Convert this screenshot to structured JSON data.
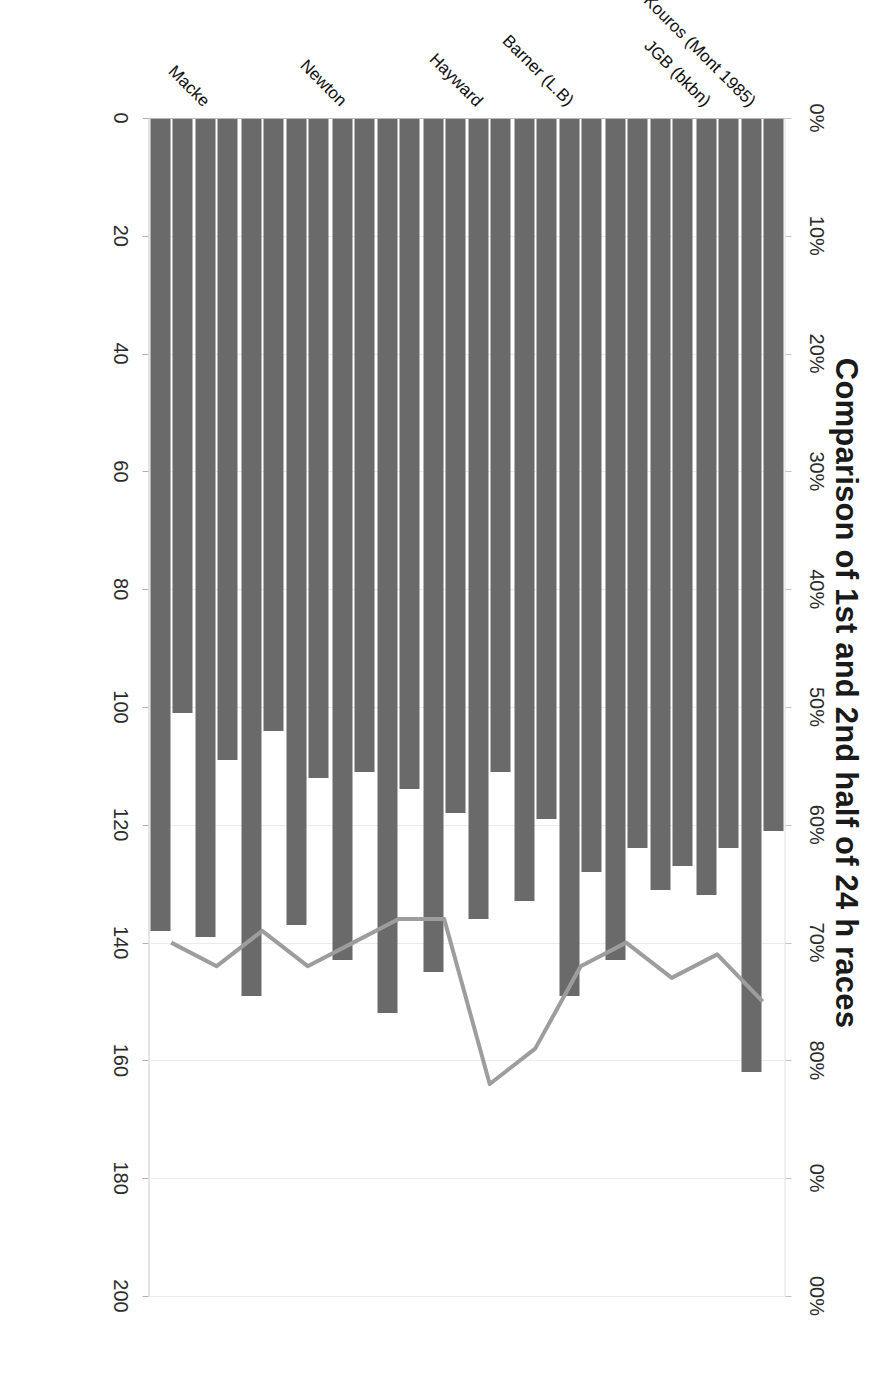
{
  "chart_data": {
    "type": "bar",
    "title": "Comparison of 1st and 2nd half of 24 h races",
    "subtitle": "",
    "xlabel": "",
    "ylabel": "",
    "orientation": "horizontal",
    "grid": true,
    "legend_position": "top-left",
    "categories": [
      "Kouros (Mont 1985)",
      "JGB (bkbn)",
      "JGB (bkbn) 2",
      "JGB (bkbn) 3",
      "Barner (L.B)",
      "Barner (L.B) 2",
      "Hayward",
      "Hayward 2",
      "Hayward 3",
      "Newton",
      "Newton 2",
      "Newton 3",
      "Macke",
      "Macke 2"
    ],
    "category_labels_shown": [
      "Kouros (Mont 1985)",
      "JGB (bkbn)",
      "Barner (L.B)",
      "Hayward",
      "Newton",
      "Macke"
    ],
    "series": [
      {
        "name": "1st half, hours 1-12",
        "axis": "primary",
        "unit": "km",
        "color": "#6a6a6a",
        "values": [
          121,
          124,
          127,
          124,
          128,
          119,
          111,
          118,
          114,
          111,
          112,
          104,
          109,
          101
        ]
      },
      {
        "name": "2n half, hours 13-24",
        "axis": "primary",
        "unit": "km",
        "color": "#6a6a6a",
        "values": [
          162,
          132,
          131,
          143,
          149,
          133,
          136,
          145,
          152,
          143,
          137,
          149,
          139,
          138
        ]
      },
      {
        "name": "ratio 2nd/1st",
        "axis": "secondary",
        "unit": "%",
        "color": "#9d9d9d",
        "values": [
          75,
          71,
          73,
          70,
          72,
          79,
          82,
          68,
          68,
          70,
          72,
          69,
          72,
          70
        ]
      }
    ],
    "primary_axis": {
      "label": "",
      "min": 0,
      "max": 200,
      "step": 20,
      "ticks": [
        "0",
        "20",
        "40",
        "60",
        "80",
        "100",
        "120",
        "140",
        "160",
        "180",
        "200"
      ]
    },
    "secondary_axis": {
      "label": "",
      "min": 0,
      "max": 100,
      "step": 10,
      "ticks": [
        "0%",
        "10%",
        "20%",
        "30%",
        "40%",
        "50%",
        "60%",
        "70%",
        "80%",
        "90%",
        "100%"
      ],
      "ticks_clipped": [
        "0%",
        "10%",
        "20%",
        "30%",
        "40%",
        "50%",
        "60%",
        "70%",
        "80%",
        "0%",
        "00%"
      ]
    }
  },
  "legend": {
    "items": [
      {
        "label": "1st half, hours 1-12",
        "marker": "bar-swatch-icon"
      },
      {
        "label": "2n half, hours 13-24",
        "marker": "bar-swatch-icon"
      },
      {
        "label": "ratio 2nd/1st",
        "marker": "line-swatch-icon"
      }
    ]
  },
  "colors": {
    "bar": "#6a6a6a",
    "line": "#9d9d9d",
    "grid": "#ebebeb",
    "text": "#111111",
    "background": "#ffffff"
  }
}
